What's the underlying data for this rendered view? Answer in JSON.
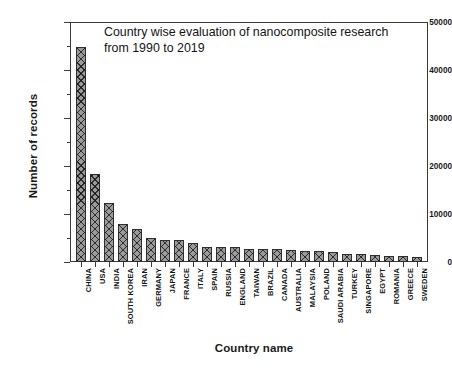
{
  "chart_data": {
    "type": "bar",
    "title": "Country wise evaluation of nanocomposite research\nfrom 1990 to 2019",
    "xlabel": "Country name",
    "ylabel": "Number of records",
    "ylim": [
      0,
      50000
    ],
    "yticks": [
      0,
      10000,
      20000,
      30000,
      40000,
      50000
    ],
    "ytick_labels": [
      "0",
      "10000",
      "20000",
      "30000",
      "40000",
      "50000"
    ],
    "minor_ticks": true,
    "grid": false,
    "legend": null,
    "categories": [
      "CHINA",
      "USA",
      "INDIA",
      "SOUTH KOREA",
      "IRAN",
      "GERMANY",
      "JAPAN",
      "FRANCE",
      "ITALY",
      "SPAIN",
      "RUSSIA",
      "ENGLAND",
      "TAIWAN",
      "BRAZIL",
      "CANADA",
      "AUSTRALIA",
      "MALAYSIA",
      "POLAND",
      "SAUDI ARABIA",
      "TURKEY",
      "SINGAPORE",
      "EGYPT",
      "ROMANIA",
      "GREECE",
      "SWEDEN"
    ],
    "values": [
      44800,
      18300,
      12300,
      7900,
      6800,
      4900,
      4500,
      4500,
      4000,
      3200,
      3200,
      3200,
      2700,
      2700,
      2700,
      2400,
      2300,
      2200,
      2100,
      1700,
      1700,
      1500,
      1200,
      1150,
      1050
    ]
  },
  "axis": {
    "y_title": "Number of records",
    "x_title": "Country name"
  }
}
